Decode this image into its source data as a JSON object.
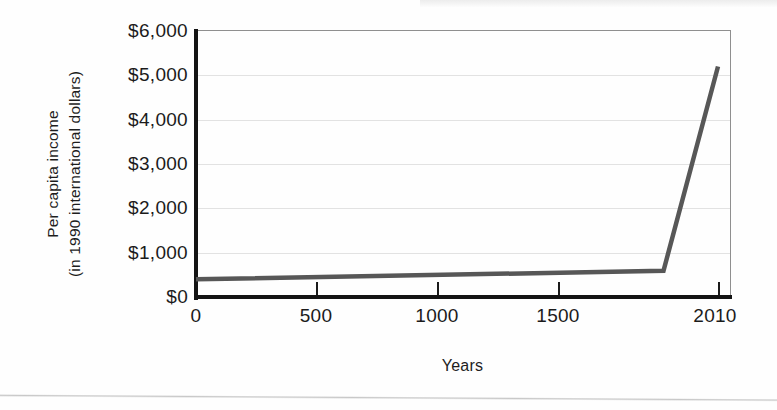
{
  "chart_data": {
    "type": "line",
    "title": "",
    "subtitle": "",
    "xlabel": "Years",
    "ylabel_line1": "Per capita income",
    "ylabel_line2": "(in 1990 international dollars)",
    "x_tick_labels": [
      "0",
      "500",
      "1000",
      "1500",
      "2010"
    ],
    "x_tick_values": [
      0,
      500,
      1000,
      1500,
      2010
    ],
    "y_tick_labels": [
      "$6,000",
      "$5,000",
      "$4,000",
      "$3,000",
      "$2,000",
      "$1,000",
      "$0"
    ],
    "y_tick_values": [
      6000,
      5000,
      4000,
      3000,
      2000,
      1000,
      0
    ],
    "xlim": [
      0,
      2010
    ],
    "ylim": [
      0,
      6000
    ],
    "grid": "horizontal",
    "legend": "none",
    "series": [
      {
        "name": "Per capita income",
        "color": "#575757",
        "x": [
          0,
          1800,
          2010
        ],
        "values": [
          400,
          590,
          5200
        ]
      }
    ]
  },
  "figure": {
    "line_color": "#575757",
    "axis_color": "#141414",
    "grid_color": "#e2e2e2",
    "text_color": "#1b1b1b",
    "background": "#ffffff"
  }
}
